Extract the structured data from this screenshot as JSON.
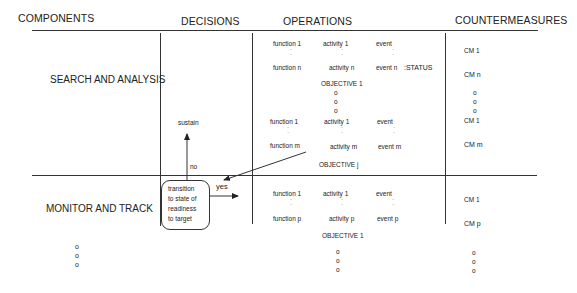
{
  "headers": {
    "components": "COMPONENTS",
    "decisions": "DECISIONS",
    "operations": "OPERATIONS",
    "countermeasures": "COUNTERMEASURES"
  },
  "components": {
    "search": "SEARCH AND ANALYSIS",
    "monitor": "MONITOR AND TRACK",
    "ellipsis": [
      "o",
      "o",
      "o"
    ]
  },
  "decisions": {
    "sustain": "sustain",
    "no": "no",
    "yes": "yes",
    "transition_box": [
      "transition",
      "to state of",
      "readiness",
      "to target"
    ]
  },
  "operations": {
    "search_block1": {
      "row1": [
        "function 1",
        "activity 1",
        "event"
      ],
      "rown": [
        "function n",
        "activity n",
        "event n"
      ],
      "status": ":STATUS",
      "objective": "OBJECTIVE 1",
      "ellipsis": [
        "o",
        "o",
        "o"
      ]
    },
    "search_block2": {
      "row1": [
        "function 1",
        "activity 1",
        "event"
      ],
      "rowm": [
        "function m",
        "activity m",
        "event m"
      ],
      "objective": "OBJECTIVE j"
    },
    "monitor_block": {
      "row1": [
        "function 1",
        "activity 1",
        "event"
      ],
      "rowp": [
        "function p",
        "activity p",
        "event p"
      ],
      "objective": "OBJECTIVE 1",
      "ellipsis": [
        "o",
        "o",
        "o"
      ]
    },
    "vdots": "·"
  },
  "countermeasures": {
    "search": [
      "CM 1",
      "CM n",
      "o",
      "o",
      "o",
      "CM 1",
      "CM m"
    ],
    "monitor": [
      "CM 1",
      "CM p"
    ],
    "ellipsis": [
      "o",
      "o",
      "o"
    ]
  }
}
